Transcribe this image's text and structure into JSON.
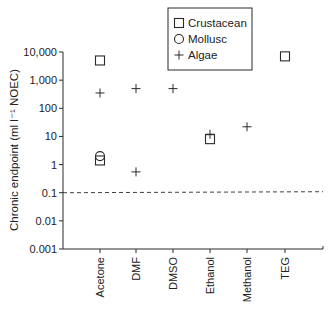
{
  "chart_data": {
    "type": "scatter",
    "title": "",
    "xlabel": "",
    "ylabel": "Chronic endpoint (ml l⁻¹ NOEC)",
    "yscale": "log",
    "ylim": [
      0.001,
      10000
    ],
    "yticks": [
      {
        "value": 10000,
        "label": "10,000"
      },
      {
        "value": 1000,
        "label": "1,000"
      },
      {
        "value": 100,
        "label": "100"
      },
      {
        "value": 10,
        "label": "10"
      },
      {
        "value": 1,
        "label": "1"
      },
      {
        "value": 0.1,
        "label": "0.1"
      },
      {
        "value": 0.01,
        "label": "0.01"
      },
      {
        "value": 0.001,
        "label": "0.001"
      }
    ],
    "categories": [
      "Acetone",
      "DMF",
      "DMSO",
      "Ethanol",
      "Methanol",
      "TEG"
    ],
    "grid": false,
    "legend_position": "top-center",
    "reference_line": {
      "value": 0.1,
      "style": "dashed"
    },
    "series": [
      {
        "name": "Crustacean",
        "marker": "square",
        "points": [
          {
            "category": "Acetone",
            "value": 5000
          },
          {
            "category": "Acetone",
            "value": 1.4
          },
          {
            "category": "Ethanol",
            "value": 8
          },
          {
            "category": "TEG",
            "value": 7000
          }
        ]
      },
      {
        "name": "Mollusc",
        "marker": "circle",
        "points": [
          {
            "category": "Acetone",
            "value": 2
          }
        ]
      },
      {
        "name": "Algae",
        "marker": "plus",
        "points": [
          {
            "category": "Acetone",
            "value": 350
          },
          {
            "category": "DMF",
            "value": 500
          },
          {
            "category": "DMF",
            "value": 0.55
          },
          {
            "category": "DMSO",
            "value": 500
          },
          {
            "category": "Ethanol",
            "value": 12
          },
          {
            "category": "Methanol",
            "value": 22
          }
        ]
      }
    ]
  },
  "legend": {
    "items": [
      {
        "label": "Crustacean",
        "icon": "square-marker-icon"
      },
      {
        "label": "Mollusc",
        "icon": "circle-marker-icon"
      },
      {
        "label": "Algae",
        "icon": "plus-marker-icon"
      }
    ]
  },
  "colors": {
    "ink": "#2a2a2a",
    "background": "#ffffff"
  }
}
